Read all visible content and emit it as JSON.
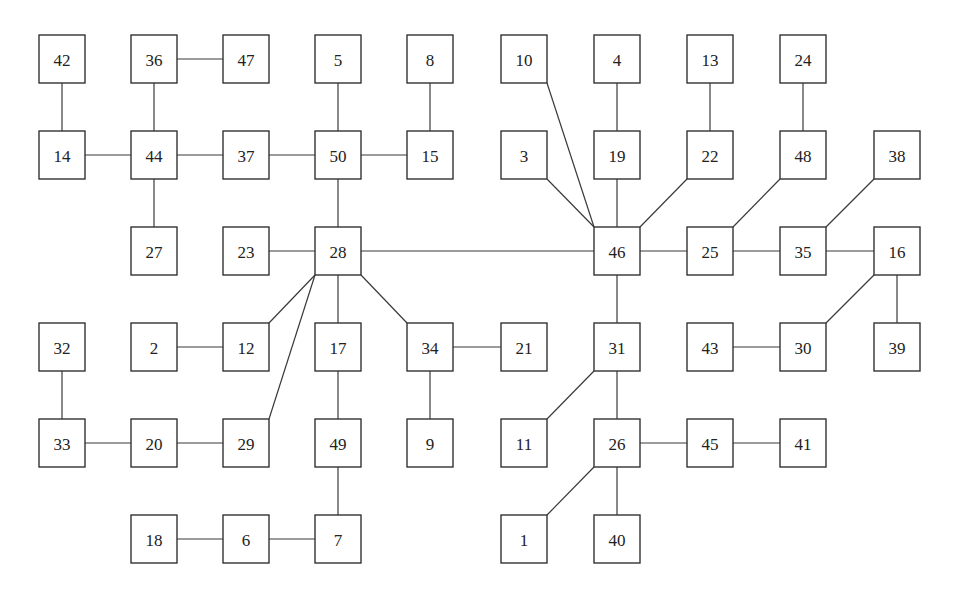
{
  "diagram": {
    "type": "tree-network",
    "colors": {
      "stroke": "#333333",
      "background": "#ffffff",
      "text": "#222222"
    },
    "nodes": [
      {
        "id": "42",
        "col": 0,
        "row": 0
      },
      {
        "id": "36",
        "col": 1,
        "row": 0
      },
      {
        "id": "47",
        "col": 2,
        "row": 0
      },
      {
        "id": "5",
        "col": 3,
        "row": 0
      },
      {
        "id": "8",
        "col": 4,
        "row": 0
      },
      {
        "id": "10",
        "col": 5,
        "row": 0
      },
      {
        "id": "4",
        "col": 6,
        "row": 0
      },
      {
        "id": "13",
        "col": 7,
        "row": 0
      },
      {
        "id": "24",
        "col": 8,
        "row": 0
      },
      {
        "id": "14",
        "col": 0,
        "row": 1
      },
      {
        "id": "44",
        "col": 1,
        "row": 1
      },
      {
        "id": "37",
        "col": 2,
        "row": 1
      },
      {
        "id": "50",
        "col": 3,
        "row": 1
      },
      {
        "id": "15",
        "col": 4,
        "row": 1
      },
      {
        "id": "3",
        "col": 5,
        "row": 1
      },
      {
        "id": "19",
        "col": 6,
        "row": 1
      },
      {
        "id": "22",
        "col": 7,
        "row": 1
      },
      {
        "id": "48",
        "col": 8,
        "row": 1
      },
      {
        "id": "38",
        "col": 9,
        "row": 1
      },
      {
        "id": "27",
        "col": 1,
        "row": 2
      },
      {
        "id": "23",
        "col": 2,
        "row": 2
      },
      {
        "id": "28",
        "col": 3,
        "row": 2
      },
      {
        "id": "46",
        "col": 6,
        "row": 2
      },
      {
        "id": "25",
        "col": 7,
        "row": 2
      },
      {
        "id": "35",
        "col": 8,
        "row": 2
      },
      {
        "id": "16",
        "col": 9,
        "row": 2
      },
      {
        "id": "32",
        "col": 0,
        "row": 3
      },
      {
        "id": "2",
        "col": 1,
        "row": 3
      },
      {
        "id": "12",
        "col": 2,
        "row": 3
      },
      {
        "id": "17",
        "col": 3,
        "row": 3
      },
      {
        "id": "34",
        "col": 4,
        "row": 3
      },
      {
        "id": "21",
        "col": 5,
        "row": 3
      },
      {
        "id": "31",
        "col": 6,
        "row": 3
      },
      {
        "id": "43",
        "col": 7,
        "row": 3
      },
      {
        "id": "30",
        "col": 8,
        "row": 3
      },
      {
        "id": "39",
        "col": 9,
        "row": 3
      },
      {
        "id": "33",
        "col": 0,
        "row": 4
      },
      {
        "id": "20",
        "col": 1,
        "row": 4
      },
      {
        "id": "29",
        "col": 2,
        "row": 4
      },
      {
        "id": "49",
        "col": 3,
        "row": 4
      },
      {
        "id": "9",
        "col": 4,
        "row": 4
      },
      {
        "id": "11",
        "col": 5,
        "row": 4
      },
      {
        "id": "26",
        "col": 6,
        "row": 4
      },
      {
        "id": "45",
        "col": 7,
        "row": 4
      },
      {
        "id": "41",
        "col": 8,
        "row": 4
      },
      {
        "id": "18",
        "col": 1,
        "row": 5
      },
      {
        "id": "6",
        "col": 2,
        "row": 5
      },
      {
        "id": "7",
        "col": 3,
        "row": 5
      },
      {
        "id": "1",
        "col": 5,
        "row": 5
      },
      {
        "id": "40",
        "col": 6,
        "row": 5
      }
    ],
    "edges": [
      [
        "42",
        "14"
      ],
      [
        "36",
        "47"
      ],
      [
        "36",
        "44"
      ],
      [
        "14",
        "44"
      ],
      [
        "44",
        "37"
      ],
      [
        "44",
        "27"
      ],
      [
        "37",
        "50"
      ],
      [
        "5",
        "50"
      ],
      [
        "50",
        "15"
      ],
      [
        "8",
        "15"
      ],
      [
        "50",
        "28"
      ],
      [
        "23",
        "28"
      ],
      [
        "28",
        "46"
      ],
      [
        "28",
        "12"
      ],
      [
        "28",
        "29"
      ],
      [
        "28",
        "17"
      ],
      [
        "28",
        "34"
      ],
      [
        "10",
        "46"
      ],
      [
        "3",
        "46"
      ],
      [
        "4",
        "19"
      ],
      [
        "19",
        "46"
      ],
      [
        "13",
        "22"
      ],
      [
        "22",
        "46"
      ],
      [
        "24",
        "48"
      ],
      [
        "48",
        "25"
      ],
      [
        "46",
        "25"
      ],
      [
        "25",
        "35"
      ],
      [
        "38",
        "35"
      ],
      [
        "35",
        "16"
      ],
      [
        "16",
        "30"
      ],
      [
        "16",
        "39"
      ],
      [
        "46",
        "31"
      ],
      [
        "2",
        "12"
      ],
      [
        "32",
        "33"
      ],
      [
        "33",
        "20"
      ],
      [
        "20",
        "29"
      ],
      [
        "17",
        "49"
      ],
      [
        "49",
        "7"
      ],
      [
        "18",
        "6"
      ],
      [
        "6",
        "7"
      ],
      [
        "34",
        "21"
      ],
      [
        "34",
        "9"
      ],
      [
        "31",
        "11"
      ],
      [
        "31",
        "26"
      ],
      [
        "43",
        "30"
      ],
      [
        "26",
        "45"
      ],
      [
        "45",
        "41"
      ],
      [
        "26",
        "1"
      ],
      [
        "26",
        "40"
      ]
    ]
  }
}
